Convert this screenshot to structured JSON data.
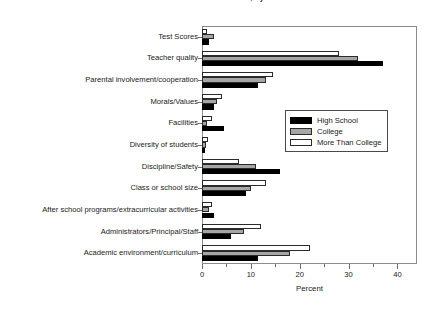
{
  "chart_data": {
    "type": "bar",
    "orientation": "horizontal",
    "title": "Most Valuable Characteristic of a School, by Parent Education",
    "xlabel": "Percent",
    "ylabel": "",
    "xlim": [
      0,
      44
    ],
    "xticks": [
      0,
      10,
      20,
      30,
      40
    ],
    "xticklabels": [
      "0",
      "10",
      "20",
      "30",
      "40"
    ],
    "grid": false,
    "legend_position": "center-right",
    "categories": [
      "Test Scores",
      "Teacher quality",
      "Parental involvement/cooperation",
      "Morals/Values",
      "Facilities",
      "Diversity of students",
      "Discipline/Safety",
      "Class or school size",
      "After school programs/extracurricular activities",
      "Administrators/Principal/Staff",
      "Academic environment/curriculum"
    ],
    "series": [
      {
        "name": "High School",
        "color": "#000000",
        "values": [
          1.5,
          37.0,
          11.5,
          2.5,
          4.5,
          0.6,
          16.0,
          9.0,
          2.5,
          6.0,
          11.5
        ]
      },
      {
        "name": "College",
        "color": "#a6a6a6",
        "values": [
          2.5,
          32.0,
          13.0,
          3.0,
          1.0,
          0.8,
          11.0,
          10.0,
          1.5,
          8.5,
          18.0
        ]
      },
      {
        "name": "More Than College",
        "color": "#ffffff",
        "values": [
          1.0,
          28.0,
          14.5,
          4.0,
          2.0,
          1.2,
          7.5,
          13.0,
          2.0,
          12.0,
          22.0
        ]
      }
    ]
  },
  "legend": {
    "items": [
      {
        "label": "High School",
        "swatch": "hs"
      },
      {
        "label": "College",
        "swatch": "col"
      },
      {
        "label": "More Than College",
        "swatch": "more"
      }
    ]
  }
}
